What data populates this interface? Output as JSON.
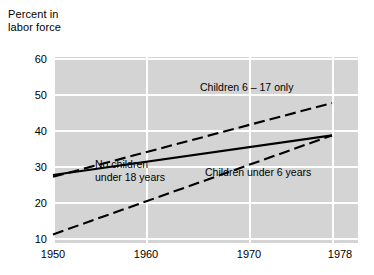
{
  "chart_data": {
    "type": "line",
    "title": "",
    "subtitle": "",
    "xlabel": "",
    "ylabel": "Percent in\nlabor force",
    "xlim": [
      1950,
      1978
    ],
    "ylim": [
      5,
      62
    ],
    "yticks": [
      60,
      50,
      40,
      30,
      20,
      10
    ],
    "xticks": [
      1950,
      1960,
      1970,
      1978
    ],
    "grid": true,
    "legend_position": "inline-annotations",
    "panel_color": "#d4d4d4",
    "grid_color": "#ffffff",
    "line_color": "#000000",
    "series": [
      {
        "name": "Children 6 - 17 only",
        "style": "dashed",
        "x": [
          1950,
          1978
        ],
        "values": [
          27,
          47.5
        ]
      },
      {
        "name": "No children under 18 years",
        "style": "solid",
        "x": [
          1950,
          1978
        ],
        "values": [
          27.5,
          38.5
        ]
      },
      {
        "name": "Children under 6 years",
        "style": "dashed",
        "x": [
          1950,
          1978
        ],
        "values": [
          11,
          38.5
        ]
      }
    ],
    "annotations": [
      {
        "text": "Children 6 - 17 only",
        "x": 1968.2,
        "y": 44.2
      },
      {
        "text": "No children\nunder 18 years",
        "x": 1958.6,
        "y": 27.0
      },
      {
        "text": "Children under 6 years",
        "x": 1971.2,
        "y": 22.6
      }
    ]
  },
  "axis": {
    "ylabel_line1": "Percent in",
    "ylabel_line2": "labor force",
    "ytick_labels": [
      "60",
      "50",
      "40",
      "30",
      "20",
      "10"
    ],
    "xtick_labels": [
      "1950",
      "1960",
      "1970",
      "1978"
    ]
  },
  "annotations": {
    "children_6_17": "Children 6 – 17 only",
    "no_children": "No children\nunder 18 years",
    "children_under_6": "Children under 6 years"
  }
}
